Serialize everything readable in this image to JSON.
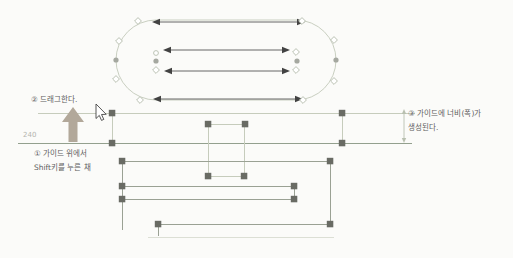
{
  "colors": {
    "background": "#fbfbf9",
    "outline": "#c9cfc1",
    "guide_light": "#c6ccbc",
    "guide_dark": "#93a08e",
    "line_mid": "#9aa194",
    "line_faint": "#dcdfd5",
    "handle": "#696b64",
    "anchor_fill": "#a5a8a0",
    "anchor_stroke": "#b6bdae",
    "arrow": "#424242",
    "dim": "#b9c0b0",
    "label": "#5d5d5d",
    "value": "#b4b4ae",
    "drag_arrow": "#b2a89a",
    "cursor_fill": "#ffffff",
    "cursor_stroke": "#444444"
  },
  "annotations": {
    "step1_line1": "① 가이드 위에서",
    "step1_line2": "Shift키를 누른 채",
    "step2": "② 드래그한다.",
    "step3_line1": "③ 가이드에 너비(폭)가",
    "step3_line2": "생성된다.",
    "guide_value": "240"
  },
  "figure": {
    "canvas": {
      "width": 513,
      "height": 258
    },
    "capsule": {
      "x": 116,
      "y": 20,
      "w": 220,
      "h": 80
    },
    "double_arrows": [
      {
        "x1": 152,
        "x2": 305,
        "y": 22
      },
      {
        "x1": 163,
        "x2": 290,
        "y": 50
      },
      {
        "x1": 164,
        "x2": 290,
        "y": 71
      },
      {
        "x1": 153,
        "x2": 303,
        "y": 99
      }
    ],
    "diamond_anchors": [
      {
        "x": 138,
        "y": 21
      },
      {
        "x": 302,
        "y": 21
      },
      {
        "x": 140,
        "y": 100
      },
      {
        "x": 303,
        "y": 100
      },
      {
        "x": 119,
        "y": 41
      },
      {
        "x": 116,
        "y": 79
      },
      {
        "x": 334,
        "y": 40
      },
      {
        "x": 334,
        "y": 81
      },
      {
        "x": 156,
        "y": 70
      },
      {
        "x": 296,
        "y": 52
      },
      {
        "x": 296,
        "y": 70
      }
    ],
    "hollow_circle_anchors": [
      {
        "x": 156,
        "y": 53
      }
    ],
    "dot_anchors": [
      {
        "x": 116,
        "y": 60
      },
      {
        "x": 336,
        "y": 60
      },
      {
        "x": 156,
        "y": 61
      },
      {
        "x": 297,
        "y": 61
      }
    ],
    "guide_lines": [
      {
        "x1": 38,
        "y1": 113.5,
        "x2": 415,
        "y2": 113.5,
        "tone": "light"
      },
      {
        "x1": 18,
        "y1": 143.5,
        "x2": 412,
        "y2": 143.5,
        "tone": "dark"
      },
      {
        "x1": 112.5,
        "y1": 113,
        "x2": 112.5,
        "y2": 143,
        "tone": "light"
      },
      {
        "x1": 342.5,
        "y1": 113,
        "x2": 342.5,
        "y2": 143,
        "tone": "light"
      },
      {
        "x1": 208,
        "y1": 124.5,
        "x2": 245,
        "y2": 124.5,
        "tone": "light"
      },
      {
        "x1": 208,
        "y1": 176.5,
        "x2": 244,
        "y2": 176.5,
        "tone": "light"
      },
      {
        "x1": 208.5,
        "y1": 124,
        "x2": 208.5,
        "y2": 176,
        "tone": "light"
      },
      {
        "x1": 244.5,
        "y1": 124,
        "x2": 244.5,
        "y2": 176,
        "tone": "light"
      },
      {
        "x1": 122,
        "y1": 161.5,
        "x2": 330,
        "y2": 161.5,
        "tone": "mid"
      },
      {
        "x1": 330.5,
        "y1": 161,
        "x2": 330.5,
        "y2": 224,
        "tone": "mid"
      },
      {
        "x1": 122.5,
        "y1": 161,
        "x2": 122.5,
        "y2": 230,
        "tone": "mid"
      },
      {
        "x1": 122,
        "y1": 186.5,
        "x2": 294,
        "y2": 186.5,
        "tone": "mid"
      },
      {
        "x1": 122,
        "y1": 199.5,
        "x2": 294,
        "y2": 199.5,
        "tone": "mid"
      },
      {
        "x1": 294.5,
        "y1": 186,
        "x2": 294.5,
        "y2": 199,
        "tone": "mid"
      },
      {
        "x1": 158,
        "y1": 224.5,
        "x2": 330,
        "y2": 224.5,
        "tone": "mid"
      },
      {
        "x1": 158.5,
        "y1": 224,
        "x2": 158.5,
        "y2": 236,
        "tone": "mid"
      },
      {
        "x1": 148,
        "y1": 237.5,
        "x2": 334,
        "y2": 237.5,
        "tone": "faint"
      }
    ],
    "handles": [
      {
        "x": 112,
        "y": 113
      },
      {
        "x": 342,
        "y": 113
      },
      {
        "x": 112,
        "y": 143
      },
      {
        "x": 342,
        "y": 143
      },
      {
        "x": 208,
        "y": 124
      },
      {
        "x": 245,
        "y": 124
      },
      {
        "x": 208,
        "y": 176
      },
      {
        "x": 244,
        "y": 176
      },
      {
        "x": 122,
        "y": 161
      },
      {
        "x": 330,
        "y": 161
      },
      {
        "x": 122,
        "y": 186
      },
      {
        "x": 294,
        "y": 186
      },
      {
        "x": 122,
        "y": 199
      },
      {
        "x": 294,
        "y": 199
      },
      {
        "x": 158,
        "y": 224
      },
      {
        "x": 330,
        "y": 224
      }
    ],
    "dimension": {
      "x": 404,
      "y1": 109,
      "y2": 143
    },
    "drag_arrow": {
      "tip_x": 73,
      "tip_y": 107,
      "head_w": 22,
      "head_h": 15,
      "shaft_w": 9,
      "base_y": 142
    },
    "cursor": {
      "x": 96,
      "y": 104
    }
  }
}
